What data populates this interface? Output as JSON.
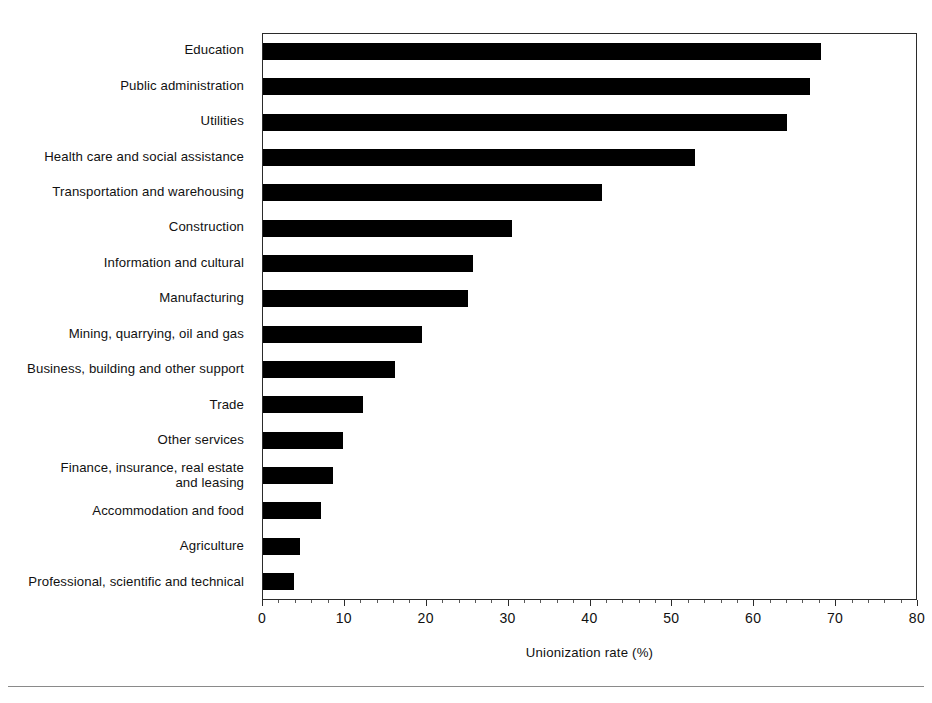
{
  "chart_data": {
    "type": "bar",
    "orientation": "horizontal",
    "title": "",
    "subtitle": "",
    "xlabel": "Unionization rate (%)",
    "ylabel": "",
    "xlim": [
      0,
      80
    ],
    "xticks": [
      0,
      10,
      20,
      30,
      40,
      50,
      60,
      70,
      80
    ],
    "xticklabels": [
      "0",
      "10",
      "20",
      "30",
      "40",
      "50",
      "60",
      "70",
      "80"
    ],
    "grid": false,
    "legend": null,
    "bar_color": "#000000",
    "categories": [
      "Education",
      "Public administration",
      "Utilities",
      "Health care and social assistance",
      "Transportation and warehousing",
      "Construction",
      "Information and cultural",
      "Manufacturing",
      "Mining, quarrying, oil and gas",
      "Business, building and other support",
      "Trade",
      "Other services",
      "Finance, insurance, real estate\nand leasing",
      "Accommodation and food",
      "Agriculture",
      "Professional, scientific and technical"
    ],
    "values": [
      68.2,
      66.8,
      64.0,
      52.8,
      41.4,
      30.4,
      25.6,
      25.0,
      19.4,
      16.1,
      12.2,
      9.8,
      8.5,
      7.1,
      4.5,
      3.8
    ]
  },
  "axis": {
    "x_title": "Unionization rate (%)",
    "ticks": [
      "0",
      "10",
      "20",
      "30",
      "40",
      "50",
      "60",
      "70",
      "80"
    ]
  }
}
